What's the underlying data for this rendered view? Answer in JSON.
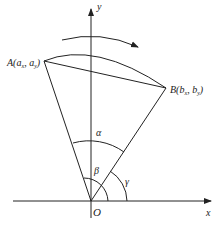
{
  "diagram": {
    "axes": {
      "x_label": "x",
      "y_label": "y",
      "origin_label": "O"
    },
    "points": {
      "A": {
        "label": "A(a",
        "sub1": "x",
        "mid": ", a",
        "sub2": "y",
        "end": ")"
      },
      "B": {
        "label": "B(b",
        "sub1": "x",
        "mid": ", b",
        "sub2": "y",
        "end": ")"
      }
    },
    "angles": {
      "alpha": "α",
      "beta": "β",
      "gamma": "γ"
    },
    "colors": {
      "stroke": "#222222",
      "background": "#ffffff"
    }
  }
}
